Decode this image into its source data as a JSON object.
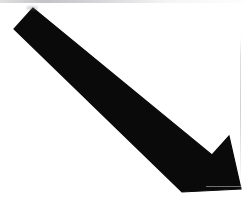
{
  "image": {
    "title": "Black diagonal arrow pointing down-right",
    "alt_text": "A thick solid black arrow angled from the upper-left corner toward the lower-right corner",
    "width": 246,
    "height": 219
  },
  "background": {
    "color": "#ffffff",
    "artifacts": [
      {
        "name": "top-edge-smudge",
        "color": "#b4b4b8"
      },
      {
        "name": "right-edge-scanline",
        "color": "#c4c4ca"
      }
    ]
  },
  "arrow": {
    "name": "arrow-down-right",
    "direction": "down-right",
    "fill_color": "#0a0a0a",
    "style": "solid",
    "tail_end": "flat-diagonal-cut",
    "head_style": "concave-barbed",
    "angle_degrees": 40,
    "shaft_thickness_px": 37,
    "polygon_points": "33,8 14,29 182,192 182,192 241,189 229,136 212,155",
    "vertices": {
      "tail_top": [
        33,
        8
      ],
      "tail_bottom": [
        14,
        29
      ],
      "barb_lower": [
        182,
        192
      ],
      "tip": [
        241,
        189
      ],
      "barb_upper": [
        229,
        136
      ],
      "notch": [
        212,
        155
      ]
    }
  }
}
